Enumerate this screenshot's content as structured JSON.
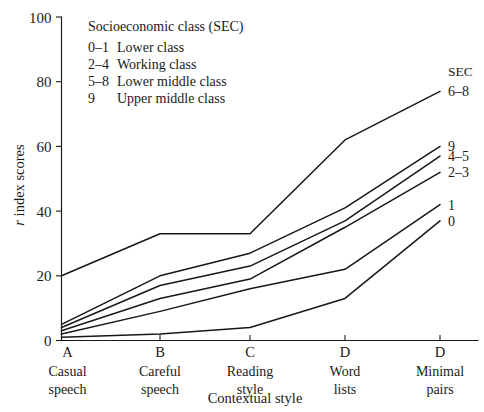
{
  "chart_data": {
    "type": "line",
    "title": "",
    "xlabel": "Contextual style",
    "ylabel": "r index scores",
    "ylabel_italic_prefix": "r",
    "ylabel_rest": " index scores",
    "ylim": [
      0,
      100
    ],
    "yticks": [
      0,
      20,
      40,
      60,
      80,
      100
    ],
    "grid": false,
    "legend_position": "right-of-plot (series end labels)",
    "x": [
      "A",
      "B",
      "C",
      "D",
      "D"
    ],
    "categories": [
      "A",
      "B",
      "C",
      "D",
      "D"
    ],
    "xtick_letters": [
      "A",
      "B",
      "C",
      "D",
      "D"
    ],
    "xtick_captions": [
      [
        "Casual",
        "speech"
      ],
      [
        "Careful",
        "speech"
      ],
      [
        "Reading",
        "style"
      ],
      [
        "Word",
        "lists"
      ],
      [
        "Minimal",
        "pairs"
      ]
    ],
    "series_group_header": "SEC",
    "series": [
      {
        "name": "6-8",
        "label": "6–8",
        "values": [
          20,
          33,
          33,
          62,
          77
        ]
      },
      {
        "name": "9",
        "label": "9",
        "values": [
          5,
          20,
          27,
          41,
          60
        ]
      },
      {
        "name": "4-5",
        "label": "4–5",
        "values": [
          4,
          17,
          23,
          37,
          57
        ]
      },
      {
        "name": "2-3",
        "label": "2–3",
        "values": [
          3,
          13,
          19,
          35,
          52
        ]
      },
      {
        "name": "1",
        "label": "1",
        "values": [
          2,
          9,
          16,
          22,
          42
        ]
      },
      {
        "name": "0",
        "label": "0",
        "values": [
          1,
          2,
          4,
          13,
          37
        ]
      }
    ]
  },
  "legend": {
    "title": "Socioeconomic class (SEC)",
    "entries": [
      {
        "code": "0–1",
        "desc": "Lower class"
      },
      {
        "code": "2–4",
        "desc": "Working class"
      },
      {
        "code": "5–8",
        "desc": "Lower middle class"
      },
      {
        "code": "9",
        "desc": "Upper middle class"
      }
    ]
  },
  "colors": {
    "ink": "#1a1a1a",
    "line": "#17171b",
    "background": "#ffffff"
  }
}
